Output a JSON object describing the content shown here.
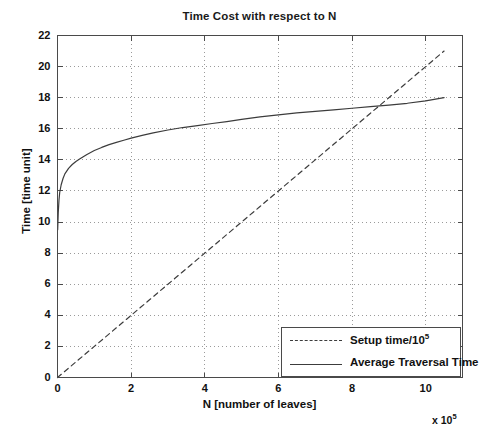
{
  "chart_data": {
    "type": "line",
    "title": "Time Cost with respect to N",
    "xlabel": "N [number of leaves]",
    "ylabel": "Time [time unit]",
    "x_exponent_label": "x 10",
    "x_exponent_power": "5",
    "xlim": [
      0,
      11
    ],
    "ylim": [
      0,
      22
    ],
    "xticks": [
      0,
      2,
      4,
      6,
      8,
      10
    ],
    "xtick_labels": [
      "0",
      "2",
      "4",
      "6",
      "8",
      "10"
    ],
    "yticks": [
      0,
      2,
      4,
      6,
      8,
      10,
      12,
      14,
      16,
      18,
      20,
      22
    ],
    "ytick_labels": [
      "0",
      "2",
      "4",
      "6",
      "8",
      "10",
      "12",
      "14",
      "16",
      "18",
      "20",
      "22"
    ],
    "grid": true,
    "grid_style": "dotted",
    "legend_position": "lower right",
    "x_unit_note": "x values are in units of 10^5 leaves",
    "series": [
      {
        "name": "Setup time/10",
        "name_sup": "5",
        "style": "dashed",
        "color": "#3c3c3c",
        "x": [
          0,
          0.5,
          1,
          1.5,
          2,
          2.5,
          3,
          3.5,
          4,
          4.5,
          5,
          5.5,
          6,
          6.5,
          7,
          7.5,
          8,
          8.5,
          9,
          9.5,
          10,
          10.5
        ],
        "y": [
          0,
          1.0,
          2.0,
          3.0,
          4.0,
          5.0,
          6.0,
          7.0,
          8.0,
          9.0,
          10.0,
          11.0,
          12.0,
          13.0,
          14.0,
          15.0,
          16.0,
          17.0,
          18.0,
          19.0,
          20.0,
          21.0
        ]
      },
      {
        "name": "Average Traversal Time",
        "style": "solid",
        "color": "#3c3c3c",
        "x": [
          0.005,
          0.02,
          0.04,
          0.06,
          0.1,
          0.15,
          0.2,
          0.3,
          0.4,
          0.5,
          0.6,
          0.7,
          0.8,
          1.0,
          1.2,
          1.4,
          1.6,
          1.8,
          2.0,
          2.3,
          2.6,
          3.0,
          3.4,
          3.8,
          4.2,
          4.6,
          5.0,
          5.5,
          6.0,
          6.5,
          7.0,
          7.5,
          8.0,
          8.5,
          9.0,
          9.5,
          10.0,
          10.5
        ],
        "y": [
          9.5,
          10.6,
          11.4,
          11.9,
          12.4,
          12.8,
          13.1,
          13.45,
          13.7,
          13.9,
          14.05,
          14.2,
          14.35,
          14.6,
          14.8,
          14.98,
          15.12,
          15.26,
          15.4,
          15.58,
          15.74,
          15.92,
          16.08,
          16.2,
          16.34,
          16.46,
          16.6,
          16.76,
          16.9,
          17.02,
          17.12,
          17.22,
          17.32,
          17.42,
          17.52,
          17.64,
          17.8,
          18.0
        ]
      }
    ]
  },
  "legend": {
    "items": [
      {
        "label": "Setup time/10",
        "sup": "5",
        "style": "dashed"
      },
      {
        "label": "Average Traversal Time",
        "sup": "",
        "style": "solid"
      }
    ]
  },
  "colors": {
    "axis": "#4a4a4a",
    "grid": "#9a9a9a",
    "line": "#3c3c3c",
    "text": "#111111",
    "background": "#ffffff"
  }
}
